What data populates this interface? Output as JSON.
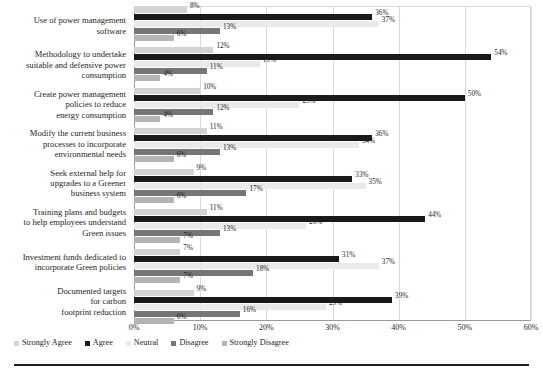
{
  "chart_data": {
    "type": "bar",
    "orientation": "horizontal",
    "title": "",
    "subtitle": "",
    "xlabel": "",
    "ylabel": "",
    "xlim": [
      0,
      60
    ],
    "xunit": "%",
    "grid": true,
    "legend_position": "bottom-left",
    "xticks": [
      "0%",
      "10%",
      "20%",
      "30%",
      "40%",
      "50%",
      "60%"
    ],
    "xtick_values": [
      0,
      10,
      20,
      30,
      40,
      50,
      60
    ],
    "categories": [
      "Use of power management software",
      "Methodology to undertake suitable and defensive power consumption",
      "Create power management policies  to reduce energy consumption",
      "Modify the current business processes to incorporate environmental needs",
      "Seek external help for upgrades to a Greener business system",
      "Training plans and budgets to help employees understand Green issues",
      "Investment funds dedicated to incorporate Green policies",
      "Documented targets for carbon footprint reduction"
    ],
    "category_lines": [
      [
        "Use of power management",
        "software"
      ],
      [
        "Methodology to undertake",
        "suitable and defensive power",
        "consumption"
      ],
      [
        "Create power management",
        "policies  to reduce",
        "energy consumption"
      ],
      [
        "Modify the current business",
        "processes to incorporate",
        "environmental needs"
      ],
      [
        "Seek external help for",
        "upgrades to a Greener",
        "business system"
      ],
      [
        "Training plans and budgets",
        "to help employees understand",
        "Green issues"
      ],
      [
        "Investment funds dedicated to",
        "incorporate Green policies"
      ],
      [
        "Documented targets",
        "for carbon",
        "footprint reduction"
      ]
    ],
    "series": [
      {
        "name": "Strongly Agree",
        "color": "#d3d3d3",
        "values": [
          8,
          12,
          10,
          11,
          9,
          11,
          7,
          9
        ],
        "labels": [
          "8%",
          "12%",
          "10%",
          "11%",
          "9%",
          "11%",
          "7%",
          "9%"
        ]
      },
      {
        "name": "Agree",
        "color": "#1a1a1a",
        "values": [
          36,
          54,
          50,
          36,
          33,
          44,
          31,
          39
        ],
        "labels": [
          "36%",
          "54%",
          "50%",
          "36%",
          "33%",
          "44%",
          "31%",
          "39%"
        ]
      },
      {
        "name": "Neutral",
        "color": "#eaeaea",
        "values": [
          37,
          19,
          25,
          34,
          35,
          26,
          37,
          29
        ],
        "labels": [
          "37%",
          "19%",
          "25%",
          "34%",
          "35%",
          "26%",
          "37%",
          "29%"
        ]
      },
      {
        "name": "Disagree",
        "color": "#767676",
        "values": [
          13,
          11,
          12,
          13,
          17,
          13,
          18,
          16
        ],
        "labels": [
          "13%",
          "11%",
          "12%",
          "13%",
          "17%",
          "13%",
          "18%",
          "16%"
        ]
      },
      {
        "name": "Strongly Disagree",
        "color": "#b4b4b4",
        "values": [
          6,
          4,
          4,
          6,
          6,
          7,
          7,
          6
        ],
        "labels": [
          "6%",
          "4%",
          "4%",
          "6%",
          "6%",
          "7%",
          "7%",
          "6%"
        ]
      }
    ]
  },
  "legend": {
    "items": [
      {
        "label": "Strongly Agree",
        "color": "#d3d3d3"
      },
      {
        "label": "Agree",
        "color": "#1a1a1a"
      },
      {
        "label": "Neutral",
        "color": "#eaeaea"
      },
      {
        "label": "Disagree",
        "color": "#767676"
      },
      {
        "label": "Strongly Disagree",
        "color": "#b4b4b4"
      }
    ]
  }
}
